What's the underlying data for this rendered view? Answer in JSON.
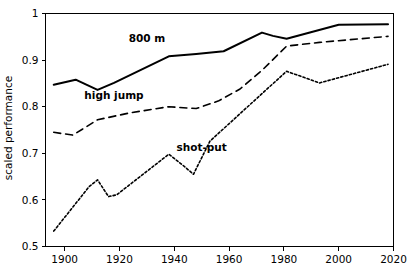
{
  "chart_data": {
    "type": "line",
    "title": "",
    "subtitle": "",
    "xlabel": "",
    "ylabel": "scaled performance",
    "xlim": [
      1893,
      2020
    ],
    "ylim": [
      0.5,
      1.0
    ],
    "xticks": [
      1900,
      1920,
      1940,
      1960,
      1980,
      2000,
      2020
    ],
    "yticks": [
      0.5,
      0.6,
      0.7,
      0.8,
      0.9,
      1
    ],
    "xtick_labels": [
      "1900",
      "1920",
      "1940",
      "1960",
      "1980",
      "2000",
      "2020"
    ],
    "ytick_labels": [
      "0.5",
      "0.6",
      "0.7",
      "0.8",
      "0.9",
      "1"
    ],
    "grid": false,
    "legend_position": "inline-annotations",
    "frame": "box",
    "series": [
      {
        "name": "800 m",
        "label": "800 m",
        "style": "solid",
        "color": "#000000",
        "label_x": 1930,
        "label_y": 0.938,
        "x": [
          1896,
          1904,
          1912,
          1918,
          1938,
          1948,
          1958,
          1972,
          1976,
          1981,
          2000,
          2018
        ],
        "y": [
          0.847,
          0.858,
          0.836,
          0.851,
          0.908,
          0.913,
          0.919,
          0.959,
          0.952,
          0.946,
          0.976,
          0.977
        ]
      },
      {
        "name": "high jump",
        "label": "high jump",
        "style": "dashed",
        "color": "#000000",
        "label_x": 1918,
        "label_y": 0.817,
        "x": [
          1896,
          1903,
          1912,
          1924,
          1938,
          1948,
          1956,
          1964,
          1972,
          1981,
          1993,
          2018
        ],
        "y": [
          0.745,
          0.739,
          0.772,
          0.787,
          0.8,
          0.796,
          0.812,
          0.838,
          0.878,
          0.93,
          0.938,
          0.951
        ]
      },
      {
        "name": "shot-put",
        "label": "shot-put",
        "style": "dotted",
        "color": "#000000",
        "label_x": 1950,
        "label_y": 0.706,
        "x": [
          1896,
          1909,
          1912,
          1916,
          1919,
          1938,
          1943,
          1947,
          1953,
          1972,
          1981,
          1993,
          2018
        ],
        "y": [
          0.533,
          0.629,
          0.643,
          0.607,
          0.611,
          0.698,
          0.675,
          0.655,
          0.726,
          0.828,
          0.876,
          0.851,
          0.891
        ]
      }
    ]
  },
  "chart": {
    "ylabel": "scaled performance"
  }
}
